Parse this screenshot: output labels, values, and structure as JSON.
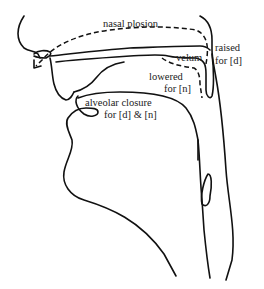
{
  "figure": {
    "type": "sagittal section of vocal tract",
    "labels": {
      "nasal_plosion": "nasal plosion",
      "velum": "velum",
      "raised_line1": "raised",
      "raised_line2": "for [d]",
      "lowered_line1": "lowered",
      "lowered_line2": "for [n]",
      "alveolar_line1": "alveolar closure",
      "alveolar_line2": "for [d] & [n]"
    },
    "colors": {
      "ink": "#111111",
      "background": "#ffffff"
    }
  }
}
